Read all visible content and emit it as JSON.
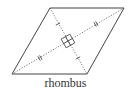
{
  "figure": {
    "label": "rhombus",
    "stroke_color": "#444444",
    "vertices": {
      "top_left": [
        50,
        8
      ],
      "top_right": [
        124,
        8
      ],
      "bottom_right": [
        87,
        74
      ],
      "bottom_left": [
        12,
        74
      ]
    },
    "diagonals": [
      {
        "name": "long",
        "from": "bottom_left",
        "to": "top_right",
        "style": "dotted",
        "tick_marks": 2
      },
      {
        "name": "short",
        "from": "top_left",
        "to": "bottom_right",
        "style": "dotted",
        "tick_marks": 1
      }
    ],
    "right_angle_marker": "center"
  }
}
